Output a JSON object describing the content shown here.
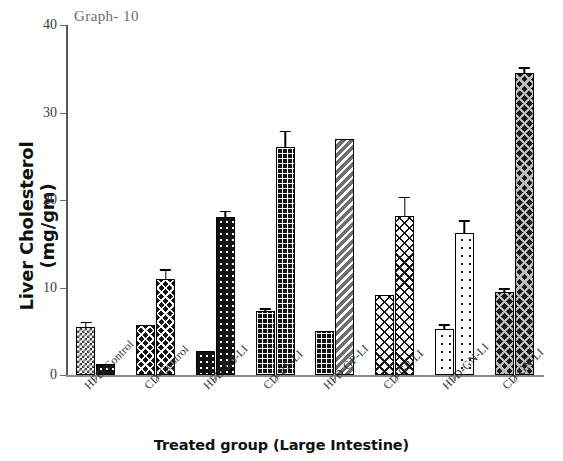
{
  "chart_data": {
    "type": "bar",
    "title": "Graph- 10",
    "xlabel": "Treated group (Large Intestine)",
    "ylabel": "Liver Cholesterol (mg/gm)",
    "ylim": [
      0,
      40
    ],
    "yticks": [
      0,
      10,
      20,
      30,
      40
    ],
    "grid": false,
    "legend": "none",
    "categories": [
      "HFD-Control",
      "CD-Control",
      "HFD-BS-LI",
      "CD-BS-LI",
      "HFD-GP-LI",
      "CD-GP-LI",
      "HFD-GN-LI",
      "CD-GN-LI"
    ],
    "series": [
      {
        "name": "Bar 1",
        "values": [
          5.5,
          5.7,
          2.7,
          7.3,
          5.0,
          9.1,
          5.3,
          9.5
        ],
        "errors": [
          0.6,
          0.0,
          0.0,
          0.35,
          0.0,
          0.0,
          0.5,
          0.45
        ]
      },
      {
        "name": "Bar 2",
        "values": [
          1.3,
          11.0,
          18.1,
          26.1,
          27.0,
          18.2,
          16.2,
          34.5
        ],
        "errors": [
          0.0,
          1.1,
          0.7,
          1.8,
          0.0,
          2.2,
          1.5,
          0.7
        ]
      }
    ],
    "bar_patterns": [
      [
        "check-light",
        "dot-dark"
      ],
      [
        "cross-dark",
        "cross-dark"
      ],
      [
        "dot-dark",
        "dot-dark"
      ],
      [
        "grid-dark",
        "grid-dark"
      ],
      [
        "grid-dark",
        "diag-gray"
      ],
      [
        "cross-white",
        "cross-white"
      ],
      [
        "dot-white",
        "dot-white"
      ],
      [
        "cross-gray",
        "cross-gray"
      ]
    ]
  }
}
